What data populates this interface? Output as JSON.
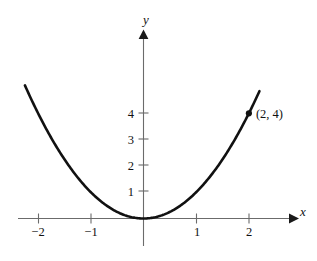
{
  "chart_data": {
    "type": "line",
    "title": "",
    "subtitle": "",
    "function": "y = x^2",
    "xlabel": "x",
    "ylabel": "y",
    "xlim": [
      -2.45,
      2.3
    ],
    "ylim": [
      -1.0,
      5.2
    ],
    "grid": false,
    "legend": false,
    "x_ticks": [
      -2,
      -1,
      1,
      2
    ],
    "x_tick_labels": [
      "−2",
      "−1",
      "1",
      "2"
    ],
    "y_ticks": [
      1,
      2,
      3,
      4
    ],
    "y_tick_labels": [
      "1",
      "2",
      "3",
      "4"
    ],
    "x": [
      -2.25,
      -2.0,
      -1.75,
      -1.5,
      -1.25,
      -1.0,
      -0.75,
      -0.5,
      -0.25,
      0,
      0.25,
      0.5,
      0.75,
      1.0,
      1.25,
      1.5,
      1.75,
      2.0,
      2.2
    ],
    "y": [
      5.06,
      4.0,
      3.06,
      2.25,
      1.56,
      1.0,
      0.56,
      0.25,
      0.06,
      0,
      0.06,
      0.25,
      0.56,
      1.0,
      1.56,
      2.25,
      3.06,
      4.0,
      4.84
    ],
    "series": [
      {
        "name": "y = x^2",
        "values": [
          5.06,
          4.0,
          3.06,
          2.25,
          1.56,
          1.0,
          0.56,
          0.25,
          0.06,
          0,
          0.06,
          0.25,
          0.56,
          1.0,
          1.56,
          2.25,
          3.06,
          4.0,
          4.84
        ]
      }
    ],
    "annotations": [
      {
        "name": "marked-point",
        "label": "(2, 4)",
        "x": 2,
        "y": 4,
        "marker": "filled-dot"
      }
    ],
    "colors": {
      "curve": "#111111",
      "axis": "#6b6b6b",
      "text": "#111111",
      "background": "#ffffff"
    }
  },
  "axes": {
    "x_axis_name": "x",
    "y_axis_name": "y"
  },
  "ticks": {
    "x": [
      {
        "label": "−2",
        "value": -2
      },
      {
        "label": "−1",
        "value": -1
      },
      {
        "label": "1",
        "value": 1
      },
      {
        "label": "2",
        "value": 2
      }
    ],
    "y": [
      {
        "label": "4",
        "value": 4
      },
      {
        "label": "3",
        "value": 3
      },
      {
        "label": "2",
        "value": 2
      },
      {
        "label": "1",
        "value": 1
      }
    ]
  },
  "point": {
    "label": "(2, 4)"
  }
}
